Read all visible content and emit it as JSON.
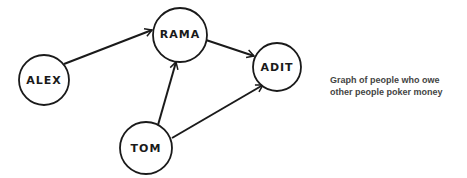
{
  "diagram": {
    "type": "directed-graph",
    "caption_lines": [
      "Graph of people who owe",
      "other people poker money"
    ],
    "nodes": [
      {
        "id": "alex",
        "label": "ALEX",
        "cx": 44,
        "cy": 80,
        "r": 25
      },
      {
        "id": "rama",
        "label": "RAMA",
        "cx": 180,
        "cy": 35,
        "r": 27
      },
      {
        "id": "adit",
        "label": "ADIT",
        "cx": 277,
        "cy": 67,
        "r": 24
      },
      {
        "id": "tom",
        "label": "TOM",
        "cx": 146,
        "cy": 148,
        "r": 26
      }
    ],
    "edges": [
      {
        "from": "ALEX",
        "to": "RAMA"
      },
      {
        "from": "RAMA",
        "to": "ADIT"
      },
      {
        "from": "TOM",
        "to": "RAMA"
      },
      {
        "from": "TOM",
        "to": "ADIT"
      }
    ],
    "colors": {
      "stroke": "#1a1a1a",
      "caption": "#444444",
      "background": "#ffffff"
    }
  }
}
